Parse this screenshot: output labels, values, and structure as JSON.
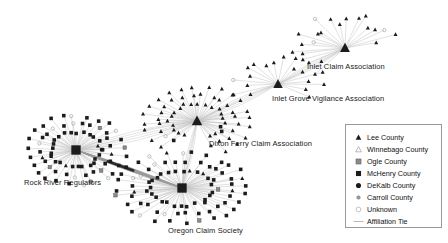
{
  "figure": {
    "type": "network-diagram",
    "background_color": "#ffffff",
    "edge_color": "#b4b4b4",
    "node_color": "#1a1a1a",
    "width": 448,
    "height": 243
  },
  "clusters": [
    {
      "id": "inlet-claim-association",
      "label": "Inlet Claim Association",
      "label_x": 307,
      "label_y": 67,
      "hub_x": 345,
      "hub_y": 48,
      "hub_size": 5.2,
      "node_symbol": "triangle-up",
      "node_count": 22,
      "radius_x": 56,
      "radius_y": 34,
      "angle_start": 118,
      "angle_end": 352,
      "density": "sparse"
    },
    {
      "id": "inlet-grove-vigilance-association",
      "label": "Inlet Grove Vigilance Association",
      "label_x": 272,
      "label_y": 99,
      "hub_x": 278,
      "hub_y": 84,
      "hub_size": 5.0,
      "node_symbol": "triangle-up",
      "node_count": 18,
      "radius_x": 50,
      "radius_y": 32,
      "angle_start": 140,
      "angle_end": 400,
      "density": "sparse"
    },
    {
      "id": "dixon-ferry-claim-association",
      "label": "Dixon Ferry Claim Association",
      "label_x": 209,
      "label_y": 141,
      "hub_x": 197,
      "hub_y": 121,
      "hub_size": 5.5,
      "node_symbol": "triangle-up",
      "node_count": 62,
      "radius_x": 52,
      "radius_y": 34,
      "angle_start": 120,
      "angle_end": 430,
      "density": "dense"
    },
    {
      "id": "rock-river-regulators",
      "label": "Rock River Regulators",
      "label_x": 24,
      "label_y": 179,
      "hub_x": 76,
      "hub_y": 150,
      "hub_size": 5.5,
      "node_symbol": "square",
      "node_count": 76,
      "radius_x": 48,
      "radius_y": 34,
      "angle_start": 0,
      "angle_end": 360,
      "density": "dense"
    },
    {
      "id": "oregon-claim-society",
      "label": "Oregon Claim Society",
      "label_x": 168,
      "label_y": 228,
      "hub_x": 182,
      "hub_y": 188,
      "hub_size": 5.5,
      "node_symbol": "square",
      "node_count": 84,
      "radius_x": 64,
      "radius_y": 34,
      "angle_start": 0,
      "angle_end": 360,
      "density": "dense"
    }
  ],
  "bridges": [
    {
      "from": "rock-river-regulators",
      "to": "oregon-claim-society",
      "weight": "heavy"
    },
    {
      "from": "rock-river-regulators",
      "to": "dixon-ferry-claim-association",
      "weight": "light"
    },
    {
      "from": "dixon-ferry-claim-association",
      "to": "oregon-claim-society",
      "weight": "light"
    },
    {
      "from": "dixon-ferry-claim-association",
      "to": "inlet-grove-vigilance-association",
      "weight": "light"
    },
    {
      "from": "inlet-grove-vigilance-association",
      "to": "inlet-claim-association",
      "weight": "light"
    }
  ],
  "legend": {
    "items": [
      {
        "label": "Lee County",
        "symbol": "triangle-up-filled"
      },
      {
        "label": "Winnebago County",
        "symbol": "triangle-up-open"
      },
      {
        "label": "Ogle County",
        "symbol": "square-gray"
      },
      {
        "label": "McHenry County",
        "symbol": "square-filled"
      },
      {
        "label": "DeKalb County",
        "symbol": "circle-filled"
      },
      {
        "label": "Carroll County",
        "symbol": "circle-small-dot"
      },
      {
        "label": "Unknown",
        "symbol": "circle-open"
      },
      {
        "label": "Affiliation Tie",
        "symbol": "line"
      }
    ]
  }
}
